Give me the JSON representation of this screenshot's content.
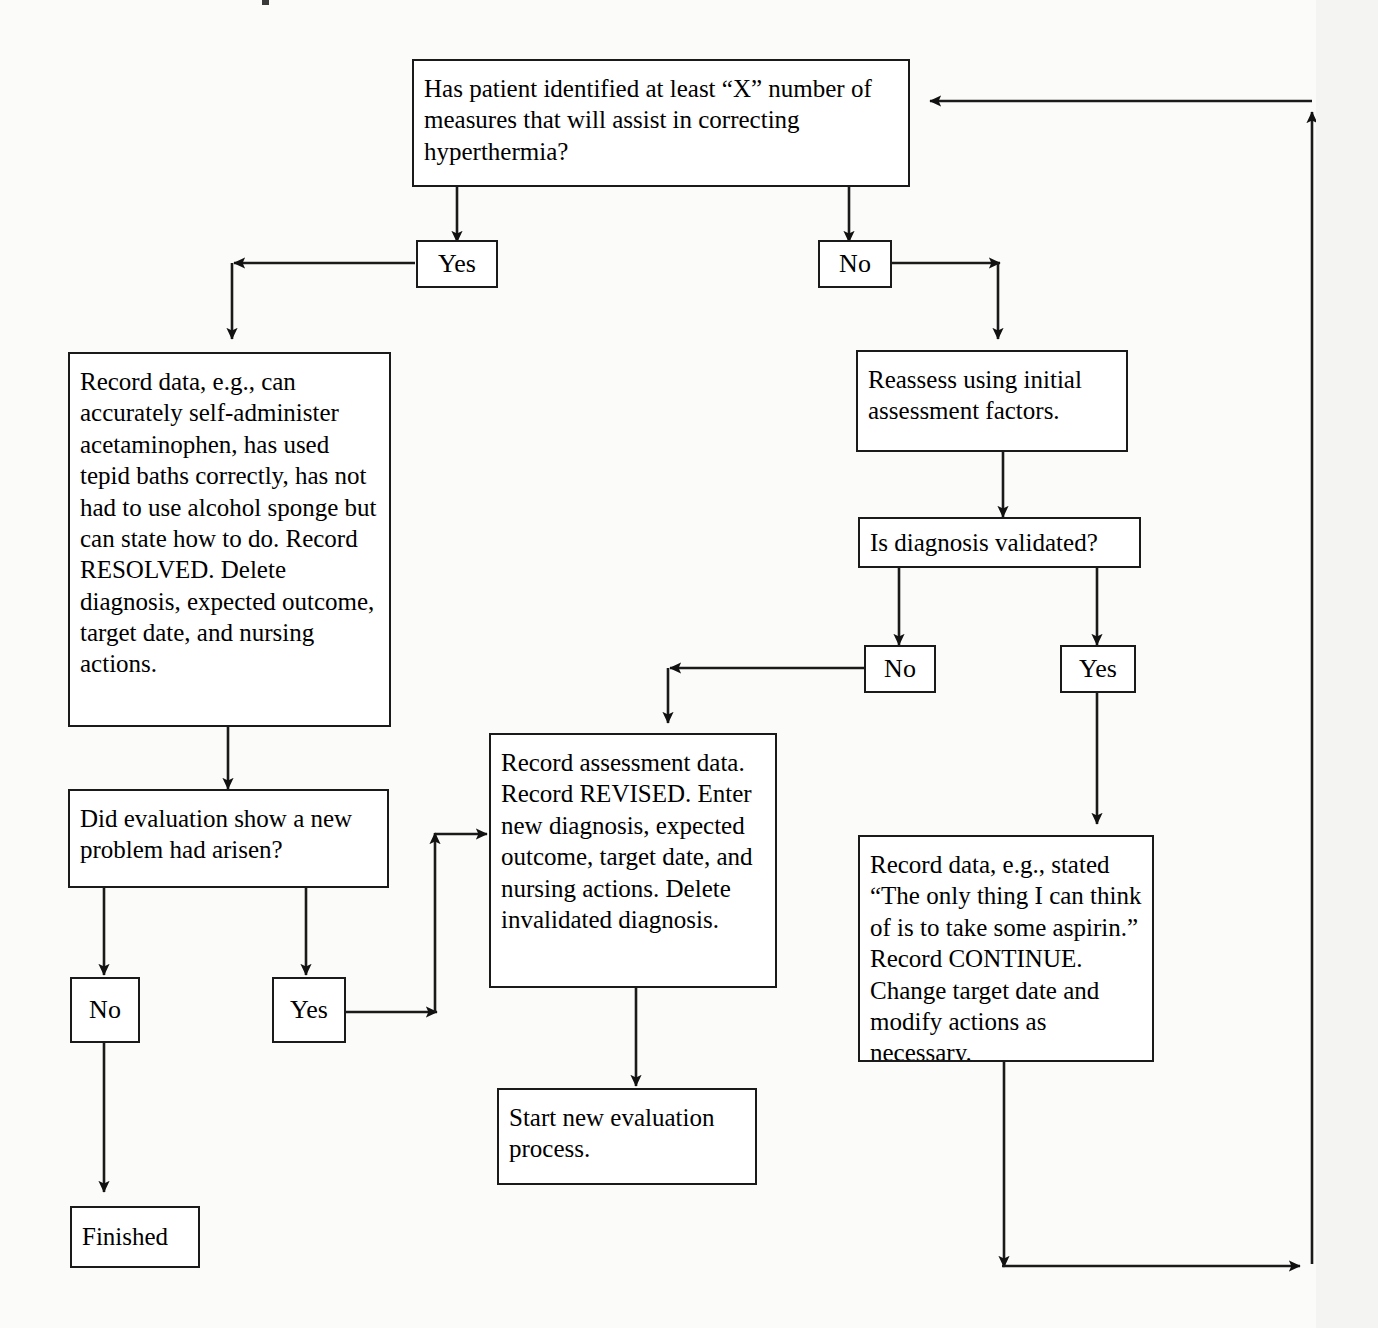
{
  "diagram": {
    "kind": "flowchart",
    "colors": {
      "background": "#fbfbfa",
      "box_fill": "#ffffff",
      "line": "#1a1a1a",
      "text": "#000000"
    },
    "nodes": {
      "root_question": "Has patient identified at least “X” number of measures that will assist in correcting hyperthermia?",
      "root_yes": "Yes",
      "root_no": "No",
      "record_resolved": "Record data, e.g., can accurately self-administer acetaminophen, has used tepid baths correctly, has not had to use alcohol sponge but can state how to do. Record RESOLVED. Delete diagnosis, expected outcome, target date, and nursing actions.",
      "reassess": "Reassess using initial assessment factors.",
      "did_evaluation": "Did evaluation show a new problem had arisen?",
      "is_validated": "Is diagnosis validated?",
      "eval_no": "No",
      "eval_yes": "Yes",
      "validated_no": "No",
      "validated_yes": "Yes",
      "record_revised": "Record assessment data. Record REVISED. Enter new diagnosis, expected outcome, target date, and nursing actions. Delete invalidated diagnosis.",
      "record_continue": "Record data, e.g., stated “The only thing I can think of is to take some aspirin.” Record CONTINUE. Change target date and modify actions as necessary.",
      "start_new": "Start new evaluation process.",
      "finished": "Finished"
    },
    "edges": [
      {
        "from": "root_question",
        "to": "root_yes",
        "label": ""
      },
      {
        "from": "root_question",
        "to": "root_no",
        "label": ""
      },
      {
        "from": "root_yes",
        "to": "record_resolved",
        "label": ""
      },
      {
        "from": "root_no",
        "to": "reassess",
        "label": ""
      },
      {
        "from": "record_resolved",
        "to": "did_evaluation",
        "label": ""
      },
      {
        "from": "did_evaluation",
        "to": "eval_no",
        "label": ""
      },
      {
        "from": "did_evaluation",
        "to": "eval_yes",
        "label": ""
      },
      {
        "from": "eval_no",
        "to": "finished",
        "label": ""
      },
      {
        "from": "eval_yes",
        "to": "record_revised",
        "label": ""
      },
      {
        "from": "reassess",
        "to": "is_validated",
        "label": ""
      },
      {
        "from": "is_validated",
        "to": "validated_no",
        "label": ""
      },
      {
        "from": "is_validated",
        "to": "validated_yes",
        "label": ""
      },
      {
        "from": "validated_no",
        "to": "record_revised",
        "label": ""
      },
      {
        "from": "validated_yes",
        "to": "record_continue",
        "label": ""
      },
      {
        "from": "record_revised",
        "to": "start_new",
        "label": ""
      },
      {
        "from": "record_continue",
        "to": "root_question",
        "label": ""
      }
    ]
  }
}
